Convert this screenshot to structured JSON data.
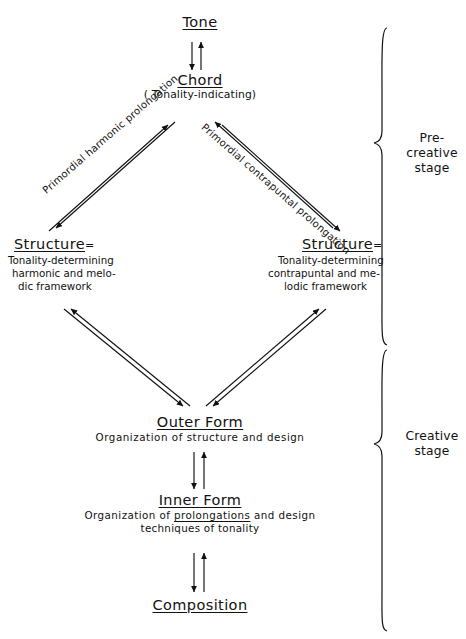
{
  "diagram": {
    "nodes": {
      "tone": {
        "label": "Tone"
      },
      "chord": {
        "label": "Chord",
        "sub": "( Tonality-indicating)"
      },
      "structure_left": {
        "label": "Structure",
        "equals": "=",
        "line1": "Tonality-determining",
        "line2": "harmonic and melo-",
        "line3": "dic framework"
      },
      "structure_right": {
        "label": "Structure",
        "equals": "=",
        "line1": "Tonality-determining",
        "line2": "contrapuntal and me-",
        "line3": "lodic framework"
      },
      "outer_form": {
        "label": "Outer Form",
        "sub": "Organization of structure and design"
      },
      "inner_form": {
        "label": "Inner Form",
        "sub_a": "Organization of ",
        "sub_underlined": "prolongations",
        "sub_b": " and design",
        "sub2": "techniques of tonality"
      },
      "composition": {
        "label": "Composition"
      }
    },
    "edge_labels": {
      "harmonic": "Primordial harmonic prolongation",
      "contrapuntal": "Primordial contrapuntal prolongation"
    },
    "stages": [
      {
        "name": "pre-creative",
        "line1": "Pre-creative",
        "line2": "stage"
      },
      {
        "name": "creative",
        "line1": "Creative",
        "line2": "stage"
      }
    ],
    "colors": {
      "ink": "#111111",
      "paper": "#ffffff"
    }
  }
}
